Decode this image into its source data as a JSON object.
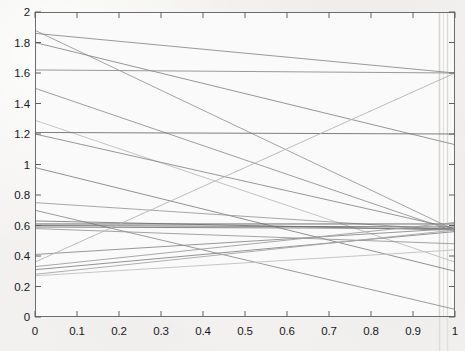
{
  "chart_data": {
    "type": "line",
    "title": "",
    "subtitle": "",
    "xlabel": "",
    "ylabel": "",
    "xlim": [
      0,
      1
    ],
    "ylim": [
      0,
      2
    ],
    "grid": false,
    "legend": null,
    "legend_position": "none",
    "x_tick_labels": [
      "0",
      "0.1",
      "0.2",
      "0.3",
      "0.4",
      "0.5",
      "0.6",
      "0.7",
      "0.8",
      "0.9",
      "1"
    ],
    "x_tick_values": [
      0,
      0.1,
      0.2,
      0.3,
      0.4,
      0.5,
      0.6,
      0.7,
      0.8,
      0.9,
      1
    ],
    "y_tick_labels": [
      "0",
      "0.2",
      "0.4",
      "0.6",
      "0.8",
      "1",
      "1.2",
      "1.4",
      "1.6",
      "1.8",
      "2"
    ],
    "y_tick_values": [
      0,
      0.2,
      0.4,
      0.6,
      0.8,
      1,
      1.2,
      1.4,
      1.6,
      1.8,
      2
    ],
    "x": [
      0,
      1
    ],
    "note": "Each series is a straight segment drawn from x=0 to x=1; values are the endpoint pair.",
    "series": [
      {
        "name": "line-01",
        "values": [
          1.88,
          0.57
        ],
        "color": "#9a9a9a"
      },
      {
        "name": "line-02",
        "values": [
          1.86,
          1.6
        ],
        "color": "#8d8d8d"
      },
      {
        "name": "line-03",
        "values": [
          1.8,
          1.13
        ],
        "color": "#8a8a8a"
      },
      {
        "name": "line-04",
        "values": [
          1.62,
          1.6
        ],
        "color": "#8f8f8f"
      },
      {
        "name": "line-05",
        "values": [
          1.5,
          0.56
        ],
        "color": "#939393"
      },
      {
        "name": "line-06",
        "values": [
          1.29,
          0.36
        ],
        "color": "#bdbdbd"
      },
      {
        "name": "line-07",
        "values": [
          1.21,
          1.2
        ],
        "color": "#6f6f6f"
      },
      {
        "name": "line-08",
        "values": [
          1.2,
          0.58
        ],
        "color": "#8b8b8b"
      },
      {
        "name": "line-09",
        "values": [
          0.98,
          0.3
        ],
        "color": "#848484"
      },
      {
        "name": "line-10",
        "values": [
          0.75,
          0.57
        ],
        "color": "#9c9c9c"
      },
      {
        "name": "line-11",
        "values": [
          0.7,
          0.05
        ],
        "color": "#909090"
      },
      {
        "name": "line-12",
        "values": [
          0.63,
          0.57
        ],
        "color": "#7d7d7d"
      },
      {
        "name": "line-13",
        "values": [
          0.61,
          0.61
        ],
        "color": "#5f5f5f"
      },
      {
        "name": "line-14",
        "values": [
          0.6,
          0.59
        ],
        "color": "#6a6a6a"
      },
      {
        "name": "line-15",
        "values": [
          0.59,
          0.58
        ],
        "color": "#787878"
      },
      {
        "name": "line-16",
        "values": [
          0.58,
          0.48
        ],
        "color": "#999999"
      },
      {
        "name": "line-17",
        "values": [
          0.41,
          0.58
        ],
        "color": "#8c8c8c"
      },
      {
        "name": "line-18",
        "values": [
          0.36,
          1.6
        ],
        "color": "#b4b4b4"
      },
      {
        "name": "line-19",
        "values": [
          0.33,
          0.62
        ],
        "color": "#9e9e9e"
      },
      {
        "name": "line-20",
        "values": [
          0.31,
          0.56
        ],
        "color": "#878787"
      },
      {
        "name": "line-21",
        "values": [
          0.28,
          0.57
        ],
        "color": "#a6a6a6"
      },
      {
        "name": "line-22",
        "values": [
          0.27,
          0.44
        ],
        "color": "#c0c0c0"
      }
    ]
  },
  "axes": {
    "frame_color": "#6b6e70",
    "background_color": "#f3f2f0",
    "tick_color": "#5d6062"
  }
}
